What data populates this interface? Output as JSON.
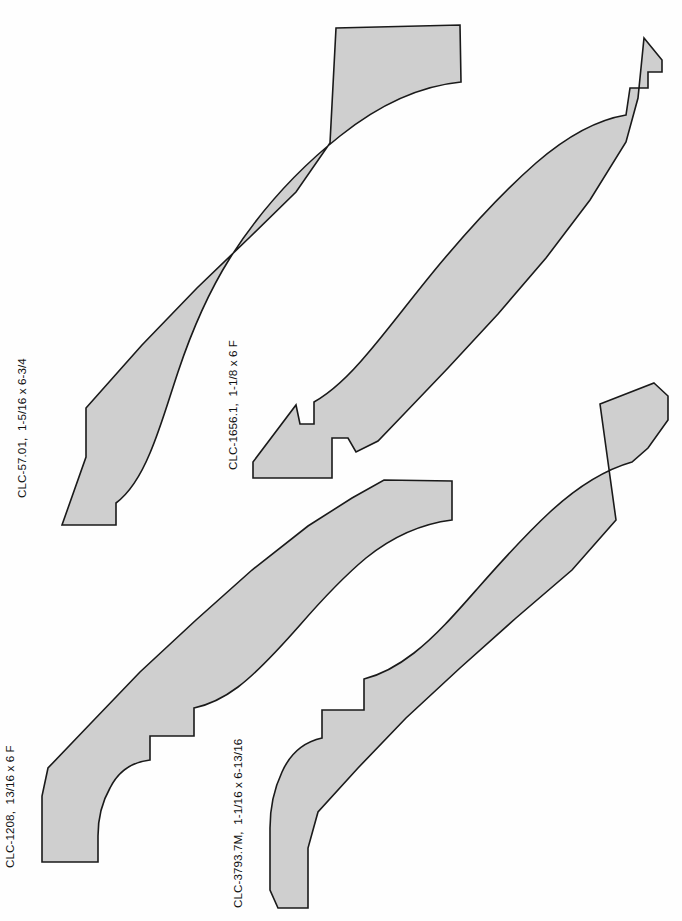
{
  "page": {
    "background_color": "#fefefe",
    "fill_color": "#cfcfcf",
    "stroke_color": "#1a1a1a",
    "width": 682,
    "height": 921
  },
  "profiles": [
    {
      "id": "profile-1",
      "label": "CLC-57.01,  1-5/16 x 6-3/4",
      "part_number": "CLC-57.01",
      "dimensions": "1-5/16 x 6-3/4",
      "label_x": 26,
      "label_y": 498,
      "path": "M 460 25 L 461 82 C 420 86 380 104 340 136 C 296 171 258 214 230 258 C 208 293 192 330 178 372 C 168 402 160 430 150 453 C 140 477 128 494 116 503 L 116 525 L 62 525 L 86 457 L 86 408 L 142 345 L 197 288 L 250 237 L 296 192 L 330 143 L 336 28 Z"
    },
    {
      "id": "profile-2",
      "label": "CLC-1656.1,  1-1/8 x 6 F",
      "part_number": "CLC-1656.1",
      "dimensions": "1-1/8 x 6 F",
      "label_x": 237,
      "label_y": 470,
      "path": "M 644 38 L 662 60 L 662 72 L 648 72 L 648 88 L 630 88 L 626 115 C 596 120 566 137 536 163 C 504 191 472 226 444 259 C 416 292 392 325 368 353 C 348 377 330 393 314 402 L 314 424 L 300 424 L 296 405 L 253 462 L 253 478 L 332 478 L 332 438 L 348 438 L 356 452 L 378 441 L 404 414 L 448 368 L 498 314 L 546 258 L 590 200 L 626 142 L 638 98 Z"
    },
    {
      "id": "profile-3",
      "label": "CLC-1208,  13/16 x 6 F",
      "part_number": "CLC-1208",
      "dimensions": "13/16 x 6 F",
      "label_x": 14,
      "label_y": 868,
      "path": "M 452 481 L 452 520 C 420 524 392 537 366 558 C 342 578 320 602 300 625 C 278 650 258 672 238 687 C 222 699 208 705 194 708 L 194 736 L 150 736 L 150 760 C 132 762 118 772 110 788 C 102 802 98 818 98 836 L 98 862 L 42 862 L 42 796 L 48 768 L 92 722 L 140 672 L 196 620 L 252 570 L 308 526 L 352 498 L 384 480 Z"
    },
    {
      "id": "profile-4",
      "label": "CLC-3793.7M,  1-1/16 x 6-13/16",
      "part_number": "CLC-3793.7M",
      "dimensions": "1-1/16 x 6-13/16",
      "label_x": 242,
      "label_y": 908,
      "path": "M 654 383 L 668 396 L 668 420 L 648 448 L 632 462 C 604 470 576 488 550 512 C 524 536 500 563 478 588 C 456 613 436 636 414 653 C 396 667 380 675 364 679 L 364 710 L 322 710 L 322 738 C 304 742 290 754 282 772 C 274 789 270 808 270 828 L 270 890 L 278 908 L 308 908 L 308 848 L 318 812 L 358 768 L 406 718 L 460 668 L 516 618 L 572 570 L 616 520 L 600 404 Z"
    }
  ]
}
